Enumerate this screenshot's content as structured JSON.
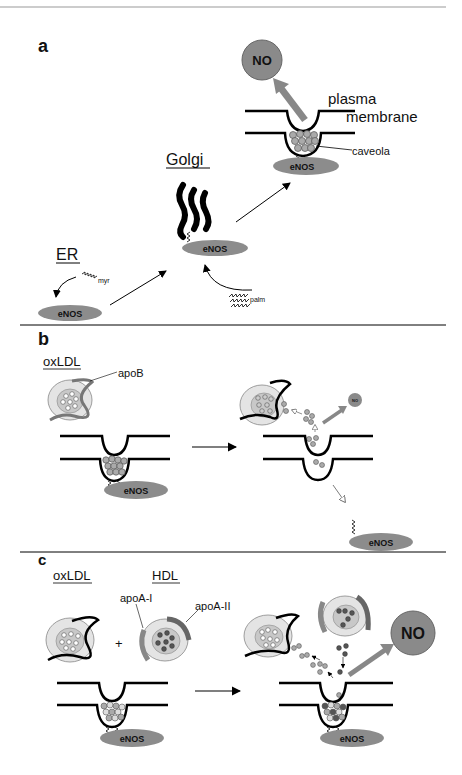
{
  "header": {
    "running_head": "C.J. Fielding"
  },
  "colors": {
    "enos_fill": "#8c8c8c",
    "no_fill": "#8a8a8a",
    "particle": "#a6a6a6",
    "dark_particle": "#555555",
    "membrane": "#000000",
    "arrow_gray": "#999999"
  },
  "panels": {
    "a": {
      "label": "a",
      "no": "NO",
      "plasma": "plasma",
      "membrane": "membrane",
      "caveola": "caveola",
      "golgi": "Golgi",
      "er": "ER",
      "myr": "myr",
      "palm": "palm",
      "enos": "eNOS"
    },
    "b": {
      "label": "b",
      "oxldl": "oxLDL",
      "apob": "apoB",
      "enos": "eNOS",
      "no": "NO"
    },
    "c": {
      "label": "c",
      "oxldl": "oxLDL",
      "hdl": "HDL",
      "apoa1": "apoA-I",
      "apoa2": "apoA-II",
      "plus": "+",
      "enos": "eNOS",
      "no": "NO"
    }
  }
}
